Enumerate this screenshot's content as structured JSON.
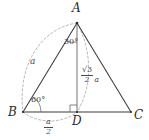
{
  "figure": {
    "kind": "geometry-diagram",
    "background_color": "#ffffff",
    "solid_line_color": "#3a3a3a",
    "dashed_line_color": "#9a9a9a",
    "label_color": "#2b2b2b",
    "vertices": [
      {
        "id": "A",
        "label": "A",
        "x": 77,
        "y": 23
      },
      {
        "id": "B",
        "label": "B",
        "x": 23,
        "y": 112
      },
      {
        "id": "C",
        "label": "C",
        "x": 131,
        "y": 112
      },
      {
        "id": "D",
        "label": "D",
        "x": 77,
        "y": 112
      }
    ],
    "vertex_label_positions": [
      {
        "id": "A",
        "text": "A",
        "left": 72,
        "top": 3
      },
      {
        "id": "B",
        "text": "B",
        "left": 9,
        "top": 108
      },
      {
        "id": "C",
        "text": "C",
        "left": 134,
        "top": 110
      },
      {
        "id": "D",
        "text": "D",
        "left": 73,
        "top": 117
      }
    ],
    "angles": [
      {
        "id": "angle-at-A",
        "text": "30°",
        "left": 66,
        "top": 40
      },
      {
        "id": "angle-at-B",
        "text": "60°",
        "left": 31,
        "top": 98
      },
      {
        "id": "right-angle-at-D",
        "text": "",
        "marker": "square"
      }
    ],
    "measures": [
      {
        "id": "side-AB",
        "text": "a",
        "left": 31,
        "top": 58
      },
      {
        "id": "segment-BD",
        "numerator": "a",
        "denominator": "2",
        "left": 43,
        "top": 119
      },
      {
        "id": "altitude-AD",
        "numerator": "√3",
        "denominator": "2",
        "suffix": "a",
        "left": 81,
        "top": 68
      }
    ],
    "edges": [
      {
        "id": "AB",
        "from": "A",
        "to": "B",
        "style": "solid"
      },
      {
        "id": "AC",
        "from": "A",
        "to": "C",
        "style": "solid"
      },
      {
        "id": "BC",
        "from": "B",
        "to": "C",
        "style": "solid"
      },
      {
        "id": "AD",
        "from": "A",
        "to": "D",
        "style": "solid"
      }
    ],
    "dashed_arcs": [
      {
        "id": "arc-AB",
        "label_ref": "side-AB"
      },
      {
        "id": "arc-AD",
        "label_ref": "altitude-AD"
      },
      {
        "id": "arc-BD",
        "label_ref": "segment-BD"
      }
    ]
  }
}
